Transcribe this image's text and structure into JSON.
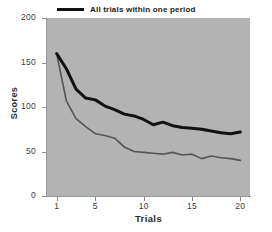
{
  "chart_data": {
    "type": "line",
    "title": "",
    "xlabel": "Trials",
    "ylabel": "Scores",
    "xlim": [
      0,
      21
    ],
    "ylim": [
      0,
      200
    ],
    "grid": false,
    "legend_position": "top-center-inside",
    "background_color": "#b3b3b3",
    "x": [
      1,
      2,
      3,
      4,
      5,
      6,
      7,
      8,
      9,
      10,
      11,
      12,
      13,
      14,
      15,
      16,
      17,
      18,
      19,
      20
    ],
    "xticks": [
      1,
      5,
      10,
      15,
      20
    ],
    "xtick_labels": [
      "1",
      "5",
      "10",
      "15",
      "20"
    ],
    "yticks": [
      0,
      50,
      100,
      150,
      200
    ],
    "ytick_labels": [
      "0",
      "50",
      "100",
      "150",
      "200"
    ],
    "series": [
      {
        "name": "All trials within one period",
        "color": "#111111",
        "line_width": 3,
        "values": [
          160,
          143,
          120,
          110,
          108,
          101,
          97,
          92,
          90,
          86,
          80,
          83,
          79,
          77,
          76,
          75,
          73,
          71,
          70,
          72
        ]
      },
      {
        "name": "One trial per day",
        "color": "#555555",
        "line_width": 1.6,
        "values": [
          160,
          107,
          87,
          78,
          70,
          68,
          65,
          55,
          50,
          49,
          48,
          47,
          49,
          46,
          47,
          42,
          45,
          43,
          42,
          40
        ]
      }
    ]
  },
  "legend": {
    "items": [
      {
        "label": "All trials within one period",
        "color": "#111111",
        "text_color": "#1a1a1a"
      },
      {
        "label": "One trial per day",
        "color": "#555555",
        "text_color": "#5b5b5b"
      }
    ]
  },
  "axes": {
    "y_title": "Scores",
    "x_title": "Trials"
  }
}
